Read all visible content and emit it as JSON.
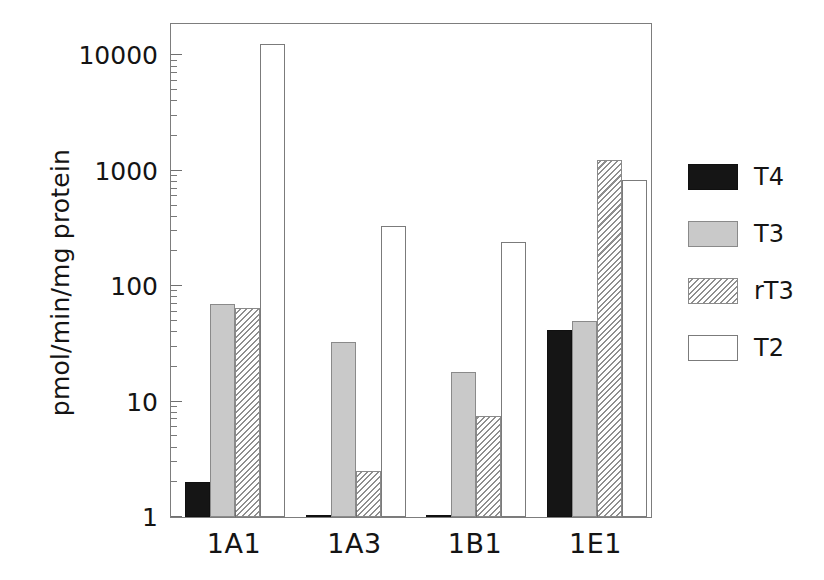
{
  "chart_data": {
    "type": "bar",
    "title": "",
    "xlabel": "",
    "ylabel": "pmol/min/mg protein",
    "yscale": "log",
    "ylim": [
      1,
      20000
    ],
    "ytick_labels": [
      "1",
      "10",
      "100",
      "1000",
      "10000"
    ],
    "ytick_values": [
      1,
      10,
      100,
      1000,
      10000
    ],
    "grid": false,
    "legend_position": "right",
    "categories": [
      "1A1",
      "1A3",
      "1B1",
      "1E1"
    ],
    "series": [
      {
        "name": "T4",
        "fill": "solid-black",
        "color": "#151515",
        "values": [
          2.0,
          1.05,
          1.0,
          42
        ]
      },
      {
        "name": "T3",
        "fill": "light-gray",
        "color": "#c9c9c9",
        "values": [
          70,
          33,
          18,
          50
        ]
      },
      {
        "name": "rT3",
        "fill": "diagonal-hatch",
        "color": "#8f8f8f",
        "values": [
          65,
          2.5,
          7.5,
          1250
        ]
      },
      {
        "name": "T2",
        "fill": "white-outline",
        "color": "#ffffff",
        "values": [
          12500,
          330,
          240,
          830
        ]
      }
    ]
  },
  "legend": {
    "items": [
      {
        "label": "T4"
      },
      {
        "label": "T3"
      },
      {
        "label": "rT3"
      },
      {
        "label": "T2"
      }
    ]
  },
  "axis": {
    "y_title": "pmol/min/mg protein"
  }
}
